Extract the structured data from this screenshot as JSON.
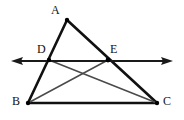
{
  "figure": {
    "background_color": "#ffffff",
    "width": 184,
    "height": 120,
    "stroke_colors": {
      "triangle": "#111111",
      "cevian": "#4a4a4a",
      "axis_line": "#1a1a1a",
      "point": "#000000",
      "label": "#111111"
    },
    "points": [
      {
        "name": "A",
        "label": "A",
        "x": 67,
        "y": 20,
        "label_x": 51,
        "label_y": 4,
        "dot": true
      },
      {
        "name": "D",
        "label": "D",
        "x": 49,
        "y": 60,
        "label_x": 37,
        "label_y": 43,
        "dot": true
      },
      {
        "name": "E",
        "label": "E",
        "x": 108,
        "y": 60,
        "label_x": 110,
        "label_y": 43,
        "dot": true
      },
      {
        "name": "B",
        "label": "B",
        "x": 28,
        "y": 103,
        "label_x": 12,
        "label_y": 95,
        "dot": true
      },
      {
        "name": "C",
        "label": "C",
        "x": 157,
        "y": 103,
        "label_x": 163,
        "label_y": 95,
        "dot": true
      }
    ],
    "segments": [
      {
        "name": "segment-AB",
        "from": "A",
        "to": "B",
        "style": "triangle",
        "width": 2.6
      },
      {
        "name": "segment-AC",
        "from": "A",
        "to": "C",
        "style": "triangle",
        "width": 2.6
      },
      {
        "name": "segment-BC",
        "from": "B",
        "to": "C",
        "style": "triangle",
        "width": 2.6
      },
      {
        "name": "segment-DC",
        "from": "D",
        "to": "C",
        "style": "cevian",
        "width": 1.5
      },
      {
        "name": "segment-BE",
        "from": "B",
        "to": "E",
        "style": "cevian",
        "width": 1.5
      }
    ],
    "axis_line": {
      "name": "line-DE-extended",
      "x1": 12,
      "y1": 61,
      "x2": 172,
      "y2": 61,
      "width": 1.8,
      "arrow_left": true,
      "arrow_right": true
    }
  }
}
